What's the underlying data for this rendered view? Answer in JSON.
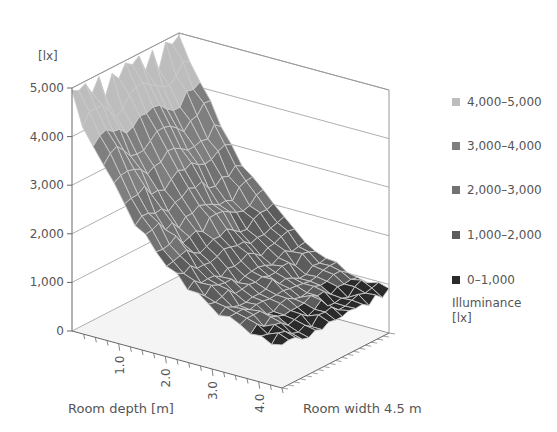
{
  "chart_data": {
    "type": "surface3d",
    "title": "",
    "zlabel": "[lx]",
    "xlabel": "Room depth [m]",
    "ylabel": "Room width 4.5 m",
    "z_ticks": [
      "0",
      "1,000",
      "2,000",
      "3,000",
      "4,000",
      "5,000"
    ],
    "z_tick_values": [
      0,
      1000,
      2000,
      3000,
      4000,
      5000
    ],
    "zlim": [
      0,
      5000
    ],
    "x_ticks": [
      "1.0",
      "2.0",
      "3.0",
      "4.0"
    ],
    "x_tick_values": [
      1.0,
      2.0,
      3.0,
      4.0
    ],
    "xlim": [
      0,
      4.5
    ],
    "ylim": [
      0,
      4.5
    ],
    "legend_title": "Illuminance [lx]",
    "legend": [
      {
        "label": "4,000–5,000",
        "min": 4000,
        "max": 5000,
        "color": "#bdbdbd"
      },
      {
        "label": "3,000–4,000",
        "min": 3000,
        "max": 4000,
        "color": "#7f7f7f"
      },
      {
        "label": "2,000–3,000",
        "min": 2000,
        "max": 3000,
        "color": "#727272"
      },
      {
        "label": "1,000–2,000",
        "min": 1000,
        "max": 2000,
        "color": "#5c5c5c"
      },
      {
        "label": "0–1,000",
        "min": 0,
        "max": 1000,
        "color": "#2a2a2a"
      }
    ],
    "profile_by_depth": {
      "depth_m": [
        0,
        0.5,
        1.0,
        1.5,
        2.0,
        2.5,
        3.0,
        3.5,
        4.0,
        4.5
      ],
      "illuminance_lx": [
        4700,
        3900,
        3100,
        2400,
        1900,
        1500,
        1250,
        1050,
        950,
        850
      ]
    }
  },
  "legend": {
    "items": [
      {
        "label": "4,000–5,000",
        "color": "#bdbdbd"
      },
      {
        "label": "3,000–4,000",
        "color": "#7f7f7f"
      },
      {
        "label": "2,000–3,000",
        "color": "#727272"
      },
      {
        "label": "1,000–2,000",
        "color": "#5c5c5c"
      },
      {
        "label": "0–1,000",
        "color": "#2a2a2a"
      }
    ],
    "title_line1": "Illuminance",
    "title_line2": "[lx]"
  },
  "axes": {
    "z_unit": "[lx]",
    "z_ticks": [
      "0",
      "1,000",
      "2,000",
      "3,000",
      "4,000",
      "5,000"
    ],
    "x_ticks": [
      "1.0",
      "2.0",
      "3.0",
      "4.0"
    ],
    "depth_title": "Room depth [m]",
    "width_title": "Room width 4.5 m"
  }
}
